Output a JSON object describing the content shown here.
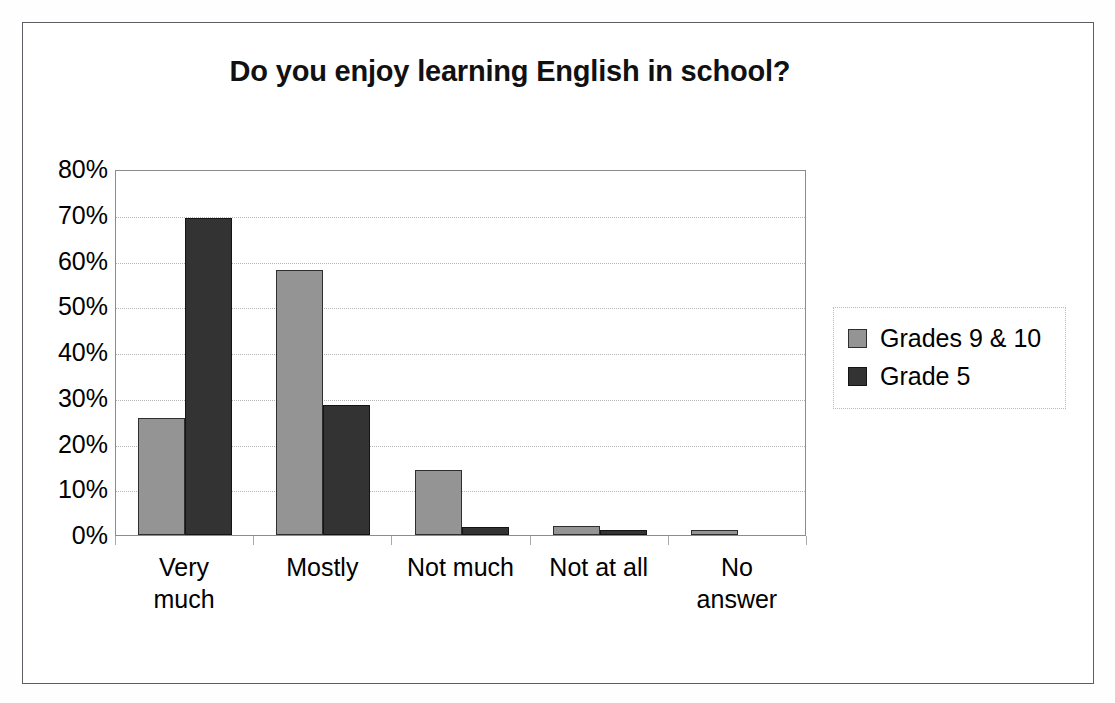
{
  "chart_data": {
    "type": "bar",
    "title": "Do you enjoy learning English in school?",
    "xlabel": "",
    "ylabel": "",
    "categories": [
      "Very much",
      "Mostly",
      "Not much",
      "Not at all",
      "No answer"
    ],
    "series": [
      {
        "name": "Grades 9 & 10",
        "color": "#949494",
        "values": [
          25.5,
          58,
          14.2,
          2,
          1
        ]
      },
      {
        "name": "Grade 5",
        "color": "#333333",
        "values": [
          69.3,
          28.5,
          1.8,
          1,
          0
        ]
      }
    ],
    "ylim": [
      0,
      80
    ],
    "ytick_values": [
      0,
      10,
      20,
      30,
      40,
      50,
      60,
      70,
      80
    ],
    "ytick_labels": [
      "0%",
      "10%",
      "20%",
      "30%",
      "40%",
      "50%",
      "60%",
      "70%",
      "80%"
    ],
    "grid": true,
    "grid_style": "dotted-horizontal",
    "legend_position": "right",
    "value_format": "percent"
  },
  "axis": {
    "y_labels": [
      "80%",
      "70%",
      "60%",
      "50%",
      "40%",
      "30%",
      "20%",
      "10%",
      "0%"
    ],
    "x_labels": [
      {
        "line1": "Very",
        "line2": "much"
      },
      {
        "line1": "Mostly",
        "line2": ""
      },
      {
        "line1": "Not much",
        "line2": ""
      },
      {
        "line1": "Not at all",
        "line2": ""
      },
      {
        "line1": "No",
        "line2": "answer"
      }
    ]
  },
  "legend": {
    "items": [
      {
        "label": "Grades 9 & 10",
        "color": "#949494"
      },
      {
        "label": "Grade 5",
        "color": "#333333"
      }
    ]
  }
}
